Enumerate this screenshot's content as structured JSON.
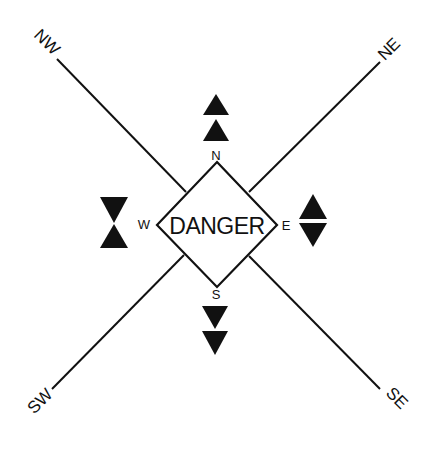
{
  "diagram": {
    "center_label": "DANGER",
    "colors": {
      "ink": "#111111",
      "background": "#ffffff"
    },
    "cardinals": [
      {
        "id": "north",
        "label": "N",
        "topmark": "two cones pointing up"
      },
      {
        "id": "east",
        "label": "E",
        "topmark": "two cones base to base"
      },
      {
        "id": "south",
        "label": "S",
        "topmark": "two cones pointing down"
      },
      {
        "id": "west",
        "label": "W",
        "topmark": "two cones point to point"
      }
    ],
    "quadrants": [
      {
        "id": "northwest",
        "label": "NW"
      },
      {
        "id": "northeast",
        "label": "NE"
      },
      {
        "id": "southwest",
        "label": "SW"
      },
      {
        "id": "southeast",
        "label": "SE"
      }
    ]
  }
}
